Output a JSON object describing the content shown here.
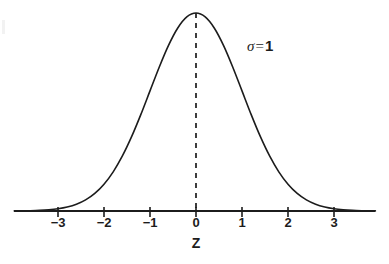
{
  "figure": {
    "background_color": "#ffffff",
    "ink_color": "#1c1c1c"
  },
  "annotations": {
    "sigma_symbol": "σ",
    "sigma_equals": "=",
    "sigma_value": "1"
  },
  "axis": {
    "title": "Z",
    "tick_labels": [
      "−3",
      "−2",
      "−1",
      "0",
      "1",
      "2",
      "3"
    ]
  },
  "chart_data": {
    "type": "line",
    "title": "",
    "subtitle": "",
    "xlabel": "Z",
    "ylabel": "",
    "xlim": [
      -3.95,
      3.9
    ],
    "ylim": [
      0,
      1.04
    ],
    "grid": false,
    "legend": null,
    "distribution": {
      "name": "standard normal",
      "mean": 0,
      "sigma": 1,
      "peak_x": 0,
      "peak_y": 1.0
    },
    "xticks": [
      -3,
      -2,
      -1,
      0,
      1,
      2,
      3
    ],
    "xticklabels": [
      "−3",
      "−2",
      "−1",
      "0",
      "1",
      "2",
      "3"
    ],
    "yticks": [],
    "yticklabels": [],
    "annotations": [
      {
        "text": "σ = 1",
        "x": 1.15,
        "y": 0.82
      }
    ],
    "series": [
      {
        "name": "standard normal density (peak normalized to 1)",
        "x": [
          -3.95,
          -3.8,
          -3.6,
          -3.4,
          -3.2,
          -3.0,
          -2.8,
          -2.6,
          -2.4,
          -2.2,
          -2.0,
          -1.8,
          -1.6,
          -1.4,
          -1.2,
          -1.0,
          -0.8,
          -0.6,
          -0.4,
          -0.2,
          0.0,
          0.2,
          0.4,
          0.6,
          0.8,
          1.0,
          1.2,
          1.4,
          1.6,
          1.8,
          2.0,
          2.2,
          2.4,
          2.6,
          2.8,
          3.0,
          3.2,
          3.4,
          3.6,
          3.8,
          3.9
        ],
        "values": [
          0.00039,
          0.00073,
          0.00153,
          0.00305,
          0.00599,
          0.01111,
          0.01984,
          0.03405,
          0.05614,
          0.08892,
          0.13534,
          0.1979,
          0.27804,
          0.37531,
          0.48675,
          0.60653,
          0.72615,
          0.83527,
          0.92312,
          0.9802,
          1.0,
          0.9802,
          0.92312,
          0.83527,
          0.72615,
          0.60653,
          0.48675,
          0.37531,
          0.27804,
          0.1979,
          0.13534,
          0.08892,
          0.05614,
          0.03405,
          0.01984,
          0.01111,
          0.00599,
          0.00305,
          0.00153,
          0.00073,
          0.0005
        ]
      }
    ],
    "reference_lines": [
      {
        "name": "mean-dashed-line",
        "orientation": "vertical",
        "x": 0,
        "style": "dashed",
        "from_y": 0,
        "to_y": 1.0
      }
    ]
  }
}
